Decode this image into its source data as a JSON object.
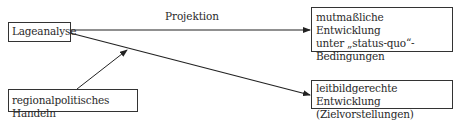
{
  "diagram": {
    "nodes": {
      "lageanalyse": "Lageanalyse",
      "handeln": "regionalpolitisches Handeln",
      "status_quo": {
        "line1": "mutmaßliche Entwicklung",
        "line2": "unter „status-quo“-",
        "line3": "Bedingungen"
      },
      "leitbild": {
        "line1": "leitbildgerechte Entwicklung",
        "line2": "(Zielvorstellungen)"
      }
    },
    "edges": [
      {
        "from": "Lageanalyse",
        "to": "mutmaßliche Entwicklung unter „status-quo“-Bedingungen",
        "label": "Projektion"
      },
      {
        "from": "Lageanalyse",
        "to": "leitbildgerechte Entwicklung (Zielvorstellungen)",
        "label": ""
      },
      {
        "from": "regionalpolitisches Handeln",
        "to": "Lageanalyse → leitbildgerechte Entwicklung (edge)",
        "label": ""
      }
    ],
    "projektion_label": "Projektion"
  }
}
